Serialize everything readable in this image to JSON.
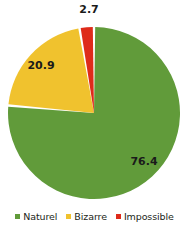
{
  "chart_data": {
    "type": "pie",
    "title": "",
    "categories": [
      "Naturel",
      "Bizarre",
      "Impossible"
    ],
    "values": [
      76.4,
      20.9,
      2.7
    ],
    "labels": [
      "76.4",
      "20.9",
      "2.7"
    ],
    "colors": [
      "#619B3A",
      "#F0C22E",
      "#DE2B1A"
    ],
    "legend_position": "bottom",
    "grid": false,
    "start_angle_deg": 0,
    "direction": "clockwise",
    "slice_gap": true,
    "background": "#FFFFFF",
    "label_color": "#1A1A1A",
    "series": [
      {
        "name": "Naturel",
        "value": 76.4,
        "label": "76.4",
        "color": "#619B3A"
      },
      {
        "name": "Bizarre",
        "value": 20.9,
        "label": "20.9",
        "color": "#F0C22E"
      },
      {
        "name": "Impossible",
        "value": 2.7,
        "label": "2.7",
        "color": "#DE2B1A"
      }
    ]
  },
  "legend": {
    "items": [
      {
        "label": "Naturel",
        "color": "#619B3A"
      },
      {
        "label": "Bizarre",
        "color": "#F0C22E"
      },
      {
        "label": "Impossible",
        "color": "#DE2B1A"
      }
    ]
  },
  "labels": {
    "green": "76.4",
    "yellow": "20.9",
    "red": "2.7"
  }
}
